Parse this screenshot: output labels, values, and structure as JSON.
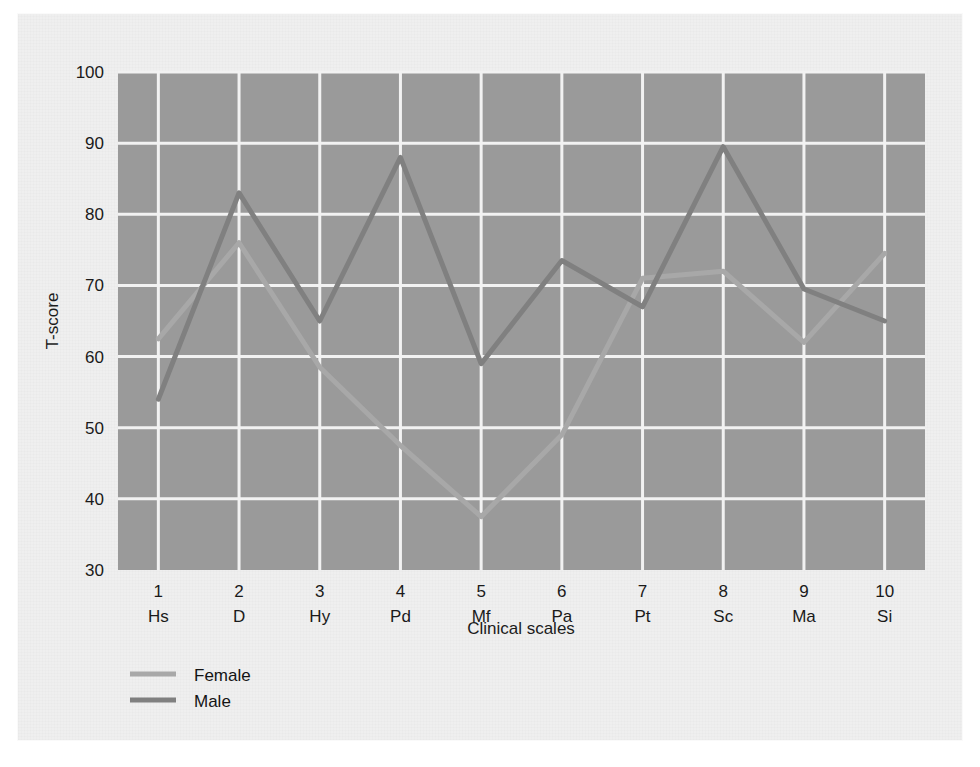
{
  "chart_data": {
    "type": "line",
    "title": "",
    "xlabel": "Clinical scales",
    "ylabel": "T-score",
    "ylim": [
      30,
      100
    ],
    "yticks": [
      30,
      40,
      50,
      60,
      70,
      80,
      90,
      100
    ],
    "grid": true,
    "legend_position": "bottom-left",
    "categories": [
      "1",
      "2",
      "3",
      "4",
      "5",
      "6",
      "7",
      "8",
      "9",
      "10"
    ],
    "category_labels": [
      "Hs",
      "D",
      "Hy",
      "Pd",
      "Mf",
      "Pa",
      "Pt",
      "Sc",
      "Ma",
      "Si"
    ],
    "series": [
      {
        "name": "Female",
        "color": "#a8a8a8",
        "values": [
          62.5,
          76,
          58.5,
          47.5,
          37.5,
          49,
          71,
          72,
          62,
          74.5
        ]
      },
      {
        "name": "Male",
        "color": "#808080",
        "values": [
          54,
          83,
          65,
          88,
          59,
          73.5,
          67,
          89.5,
          69.5,
          65
        ]
      }
    ]
  },
  "axis": {
    "y_title": "T-score",
    "x_title": "Clinical scales",
    "y_tick_labels": [
      "100",
      "90",
      "80",
      "70",
      "60",
      "50",
      "40",
      "30"
    ]
  },
  "legend": {
    "items": [
      {
        "label": "Female",
        "color": "#a8a8a8"
      },
      {
        "label": "Male",
        "color": "#808080"
      }
    ]
  },
  "style": {
    "plot_background": "#9a9a9a",
    "gridline_color": "#f2f2f2",
    "page_background": "#efefef",
    "text_color": "#1a1a1a"
  },
  "ghost_text": {
    "top": "",
    "middle": "",
    "bottom": "",
    "right": ""
  }
}
